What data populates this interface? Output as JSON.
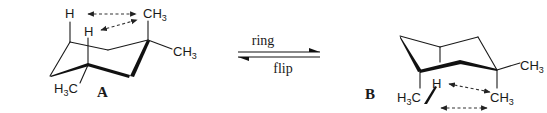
{
  "figure": {
    "corner_fragment": "",
    "conformer_a": {
      "label": "A",
      "substituents": {
        "axial_h_1": "H",
        "axial_h_2": "H",
        "methyl_axial": "CH",
        "methyl_axial_sub": "3",
        "methyl_equatorial": "CH",
        "methyl_equatorial_sub": "3",
        "methyl_c1_prefix": "H",
        "methyl_c1_sub": "3",
        "methyl_c1_suffix": "C"
      }
    },
    "equilibrium": {
      "top_label": "ring",
      "bottom_label": "flip"
    },
    "conformer_b": {
      "label": "B",
      "substituents": {
        "axial_h": "H",
        "methyl_right": "CH",
        "methyl_right_sub": "3",
        "methyl_axial": "CH",
        "methyl_axial_sub": "3",
        "methyl_c1_prefix": "H",
        "methyl_c1_sub": "3",
        "methyl_c1_suffix": "C"
      }
    },
    "colors": {
      "ink": "#1a1a1a",
      "background": "#ffffff"
    }
  }
}
